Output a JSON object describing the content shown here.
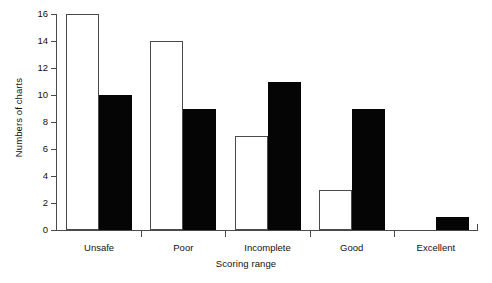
{
  "chart_data": {
    "type": "bar",
    "title": "",
    "subtitle": "",
    "xlabel": "Scoring range",
    "ylabel": "Numbers of charts",
    "categories": [
      "Unsafe",
      "Poor",
      "Incomplete",
      "Good",
      "Excellent"
    ],
    "series": [
      {
        "name": "open",
        "style": "white-outlined",
        "values": [
          16,
          14,
          7,
          3,
          0
        ]
      },
      {
        "name": "filled",
        "style": "black-filled",
        "values": [
          10,
          9,
          11,
          9,
          1
        ]
      }
    ],
    "ylim": [
      0,
      16
    ],
    "ytick_labels": [
      "0",
      "2",
      "4",
      "6",
      "8",
      "10",
      "12",
      "14",
      "16"
    ],
    "ytick_values": [
      0,
      2,
      4,
      6,
      8,
      10,
      12,
      14,
      16
    ],
    "grid": false,
    "legend": "none",
    "colors": {
      "open_fill": "#ffffff",
      "open_edge": "#4a4a4a",
      "filled_fill": "#050505",
      "axis": "#4a4a4a",
      "text": "#111111",
      "background": "#ffffff"
    }
  }
}
